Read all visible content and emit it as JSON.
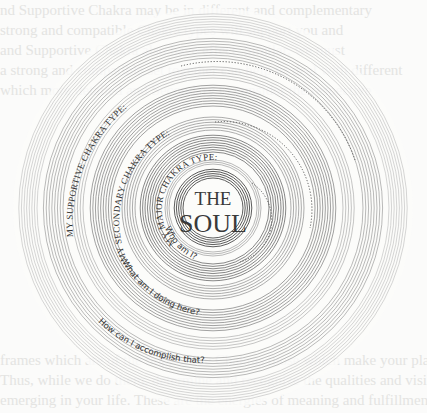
{
  "diagram": {
    "center_title_line1": "THE",
    "center_title_line2": "SOUL",
    "labels": {
      "major": "MY MAJOR CHAKRA TYPE:",
      "secondary": "MY SECONDARY CHAKRA TYPE:",
      "supportive": "MY SUPPORTIVE CHAKRA TYPE:"
    },
    "questions": {
      "q1": "Who am I?",
      "q2": "What am I doing here?",
      "q3": "How can I accomplish that?"
    }
  },
  "background_bleed_text": [
    "                 nd Supportive Chakra may be in different and complementary ",
    "                    strong and compatible Chakra types will support you and ",
    "           and Supportive Chakra  also have effect. Similar, we must",
    "    a strong and compatible set together can help us deal with different",
    "  which more detailed and Secondary to consider the respective",
    "  thinking about how these Chakras support and defined.",
    "",
    "",
    "",
    "",
    "",
    "",
    "",
    "",
    "",
    "",
    "",
    "",
    "",
    "",
    "  frames which are of the Supportive Chakras those which make your place",
    "  Thus, while we do them, determine and recognize the qualities and vision",
    "  emerging in your life. These are the energies of meaning and fulfillment"
  ],
  "colors": {
    "ring": "#8a8a8a",
    "ring_dark": "#555555",
    "text": "#333333",
    "background": "#fbfbfa"
  }
}
